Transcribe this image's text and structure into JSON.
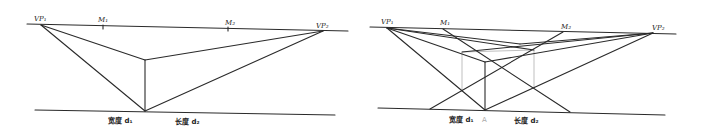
{
  "figure": {
    "colors": {
      "line": "#2a2a2a",
      "construction": "#b8b8b8",
      "background": "#ffffff"
    }
  },
  "left_panel": {
    "labels": {
      "vp1": "VP₁",
      "m1": "M₁",
      "m2": "M₂",
      "vp2": "VP₂",
      "width": "宽度 d₁",
      "length": "长度 d₂"
    }
  },
  "right_panel": {
    "labels": {
      "vp1": "VP₁",
      "m1": "M₁",
      "m2": "M₂",
      "vp2": "VP₂",
      "width": "宽度 d₁",
      "length": "长度 d₂",
      "point_a": "A"
    }
  }
}
